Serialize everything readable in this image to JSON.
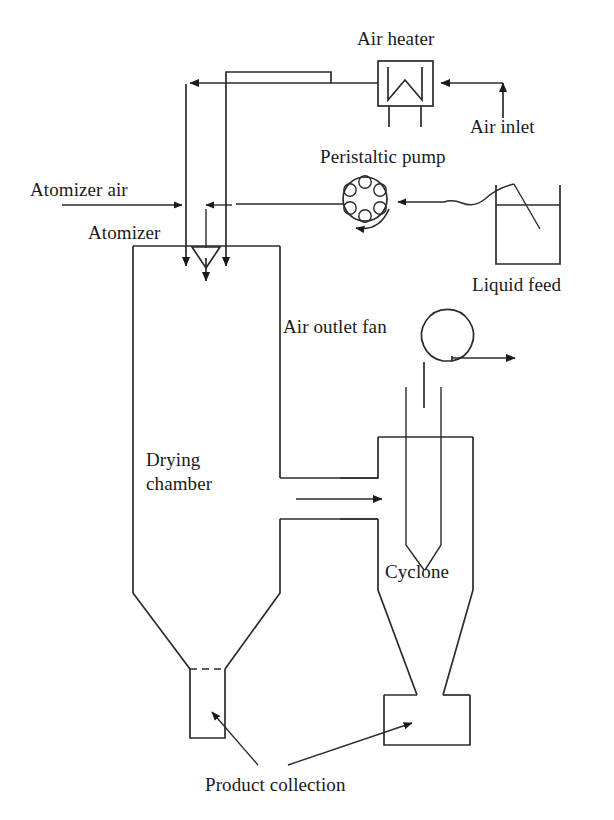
{
  "figure": {
    "background_color": "#ffffff",
    "line_color": "#2b2b2b",
    "text_color": "#1a1a1a"
  },
  "labels": {
    "air_heater": "Air heater",
    "air_inlet": "Air inlet",
    "peristaltic_pump": "Peristaltic pump",
    "atomizer_air": "Atomizer air",
    "atomizer": "Atomizer",
    "liquid_feed": "Liquid feed",
    "air_outlet_fan": "Air outlet fan",
    "drying_chamber_line1": "Drying",
    "drying_chamber_line2": "chamber",
    "cyclone": "Cyclone",
    "product_collection": "Product collection"
  },
  "components": [
    {
      "id": "air-heater",
      "label": "Air heater",
      "type": "heater-box"
    },
    {
      "id": "air-inlet",
      "label": "Air inlet",
      "type": "inlet-arrow"
    },
    {
      "id": "peristaltic-pump",
      "label": "Peristaltic pump",
      "type": "roller-pump",
      "rollers": 6
    },
    {
      "id": "liquid-feed",
      "label": "Liquid feed",
      "type": "beaker"
    },
    {
      "id": "atomizer",
      "label": "Atomizer",
      "type": "nozzle"
    },
    {
      "id": "atomizer-air",
      "label": "Atomizer air",
      "type": "supply-line"
    },
    {
      "id": "drying-chamber",
      "label": "Drying chamber",
      "type": "vessel-with-cone"
    },
    {
      "id": "cyclone",
      "label": "Cyclone",
      "type": "cyclone-separator"
    },
    {
      "id": "air-outlet-fan",
      "label": "Air outlet fan",
      "type": "centrifugal-fan"
    },
    {
      "id": "product-collection-chamber",
      "label": "Product collection",
      "type": "collection-jar"
    },
    {
      "id": "product-collection-cyclone",
      "label": "Product collection",
      "type": "collection-box"
    }
  ],
  "flows": [
    {
      "from": "air-inlet",
      "to": "air-heater",
      "direction": "left"
    },
    {
      "from": "air-heater",
      "to": "drying-chamber",
      "direction": "left-then-down"
    },
    {
      "from": "liquid-feed",
      "to": "peristaltic-pump",
      "direction": "left"
    },
    {
      "from": "peristaltic-pump",
      "to": "atomizer",
      "direction": "left"
    },
    {
      "from": "atomizer-air",
      "to": "atomizer",
      "direction": "right"
    },
    {
      "from": "drying-chamber",
      "to": "cyclone",
      "direction": "right"
    },
    {
      "from": "cyclone",
      "to": "air-outlet-fan",
      "direction": "up"
    },
    {
      "from": "air-outlet-fan",
      "to": "exhaust",
      "direction": "right"
    }
  ]
}
